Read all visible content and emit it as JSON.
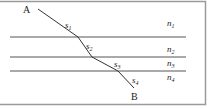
{
  "diagram": {
    "type": "refraction-path",
    "points": {
      "start_label": "A",
      "end_label": "B"
    },
    "segments": [
      {
        "label": "s",
        "sub": "1"
      },
      {
        "label": "s",
        "sub": "2"
      },
      {
        "label": "s",
        "sub": "3"
      },
      {
        "label": "s",
        "sub": "4"
      }
    ],
    "media": [
      {
        "label": "n",
        "sub": "1"
      },
      {
        "label": "n",
        "sub": "2"
      },
      {
        "label": "n",
        "sub": "3"
      },
      {
        "label": "n",
        "sub": "4"
      }
    ],
    "colors": {
      "line": "#555555",
      "border": "#9a9a9a",
      "text": "#222222"
    }
  }
}
